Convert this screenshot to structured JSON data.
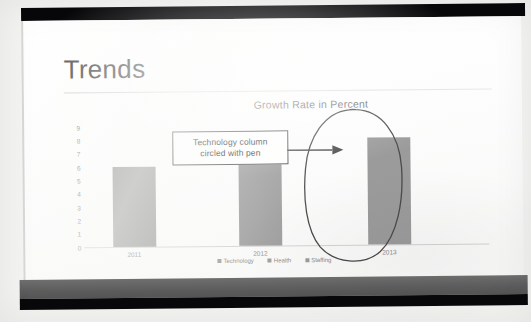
{
  "slide": {
    "title": "Trends",
    "chart_title": "Growth Rate in Percent"
  },
  "callout": {
    "line1": "Technology column",
    "line2": "circled with pen",
    "arrow": "right-arrow",
    "pen_mark": "hand-drawn-ellipse"
  },
  "colors": {
    "bar": "#9b9b9b",
    "axis": "#d2d2d2",
    "title_text": "#3b3b3b",
    "label_text": "#8a8a8a",
    "callout_border": "#4d4d4d",
    "bezel": "#08080a",
    "bezel_gray": "#6f6f6f"
  },
  "chart_data": {
    "type": "bar",
    "title": "Growth Rate in Percent",
    "xlabel": "",
    "ylabel": "",
    "categories": [
      "2011",
      "2012",
      "2013"
    ],
    "series": [
      {
        "name": "Technology",
        "values": [
          6,
          7,
          8
        ]
      }
    ],
    "legend_entries": [
      "Technology",
      "Health",
      "Staffing"
    ],
    "legend_position": "bottom",
    "ylim": [
      0,
      9
    ],
    "yticks": [
      "9",
      "8",
      "7",
      "6",
      "5",
      "4",
      "3",
      "2",
      "1",
      "0"
    ],
    "grid": false,
    "annotations": [
      {
        "text": "Technology column circled with pen",
        "target": "2013",
        "type": "callout-with-arrow"
      },
      {
        "text": "",
        "target": "2013",
        "type": "pen-ellipse"
      }
    ]
  }
}
